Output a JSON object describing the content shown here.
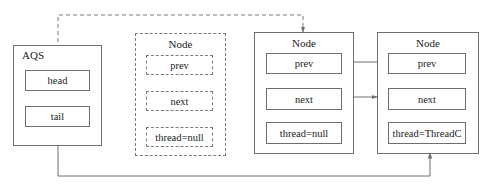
{
  "aqs": {
    "label": "AQS",
    "fields": [
      {
        "label": "head"
      },
      {
        "label": "tail"
      }
    ]
  },
  "nodes": [
    {
      "title": "Node",
      "style": "dashed",
      "fields": [
        {
          "label": "prev"
        },
        {
          "label": "next"
        },
        {
          "label": "thread=null"
        }
      ]
    },
    {
      "title": "Node",
      "style": "solid",
      "fields": [
        {
          "label": "prev"
        },
        {
          "label": "next"
        },
        {
          "label": "thread=null"
        }
      ]
    },
    {
      "title": "Node",
      "style": "solid",
      "fields": [
        {
          "label": "prev"
        },
        {
          "label": "next"
        },
        {
          "label": "thread=ThreadC"
        }
      ]
    }
  ],
  "connections": [
    {
      "from": "aqs.head",
      "to": "nodes.1",
      "style": "dashed"
    },
    {
      "from": "aqs.tail",
      "to": "nodes.2",
      "style": "solid"
    },
    {
      "from": "nodes.2.prev",
      "to": "nodes.1",
      "style": "solid"
    },
    {
      "from": "nodes.1.next",
      "to": "nodes.2",
      "style": "solid"
    }
  ],
  "colors": {
    "line": "#6e6e6e",
    "background": "#ffffff",
    "text": "#222222"
  }
}
